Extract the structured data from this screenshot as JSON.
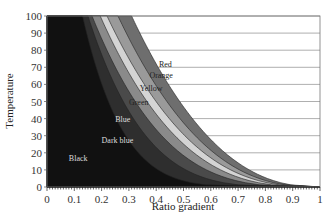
{
  "chart_data": {
    "type": "area",
    "title": "",
    "xlabel": "Ratio gradient",
    "ylabel": "Temperature",
    "xlim": [
      0,
      1
    ],
    "ylim": [
      0,
      100
    ],
    "x_ticks": [
      "0",
      "0.1",
      "0.2",
      "0.3",
      "0.4",
      "0.5",
      "0.6",
      "0.7",
      "0.8",
      "0.9",
      "1"
    ],
    "y_ticks": [
      "0",
      "10",
      "20",
      "30",
      "40",
      "50",
      "60",
      "70",
      "80",
      "90",
      "100"
    ],
    "grid": "horizontal",
    "legend": "inline labels",
    "regions": [
      {
        "name": "Black",
        "color": "#111111",
        "upper_boundary_top_x": 0.13,
        "exponent": 6.0,
        "label_pos": [
          0.08,
          15
        ]
      },
      {
        "name": "Dark blue",
        "color": "#2e2e2e",
        "upper_boundary_top_x": 0.15,
        "exponent": 4.2,
        "label_pos": [
          0.2,
          26
        ]
      },
      {
        "name": "Blue",
        "color": "#4a4a4a",
        "upper_boundary_top_x": 0.165,
        "exponent": 3.3,
        "label_pos": [
          0.25,
          38
        ]
      },
      {
        "name": "Green",
        "color": "#8a8a8a",
        "upper_boundary_top_x": 0.195,
        "exponent": 2.9,
        "label_pos": [
          0.3,
          48
        ]
      },
      {
        "name": "Yellow",
        "color": "#d4d4d4",
        "upper_boundary_top_x": 0.22,
        "exponent": 2.65,
        "label_pos": [
          0.34,
          56
        ]
      },
      {
        "name": "Orange",
        "color": "#9a9a9a",
        "upper_boundary_top_x": 0.26,
        "exponent": 2.5,
        "label_pos": [
          0.375,
          64
        ]
      },
      {
        "name": "Red",
        "color": "#6e6e6e",
        "upper_boundary_top_x": 0.31,
        "exponent": 2.35,
        "label_pos": [
          0.41,
          70
        ]
      }
    ]
  },
  "labels": {
    "xlabel": "Ratio gradient",
    "ylabel": "Temperature"
  }
}
